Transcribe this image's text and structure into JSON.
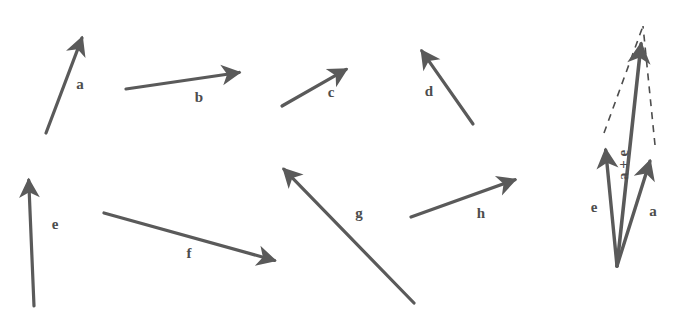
{
  "figure": {
    "background_color": "#ffffff",
    "stroke_color": "#5a5a5a",
    "label_color": "#4d4d4d",
    "width": 678,
    "height": 317
  },
  "vectors": [
    {
      "id": "a",
      "label": "a",
      "start": [
        46,
        133
      ],
      "end": [
        88,
        22
      ],
      "label_pos": [
        80,
        86
      ],
      "style": "solid",
      "arrowhead": "end"
    },
    {
      "id": "b",
      "label": "b",
      "start": [
        126,
        89
      ],
      "end": [
        256,
        70
      ],
      "label_pos": [
        199,
        99
      ],
      "style": "solid",
      "arrowhead": "end"
    },
    {
      "id": "c",
      "label": "c",
      "start": [
        282,
        106
      ],
      "end": [
        361,
        61
      ],
      "label_pos": [
        331,
        94
      ],
      "style": "solid",
      "arrowhead": "end"
    },
    {
      "id": "d",
      "label": "d",
      "start": [
        473,
        124
      ],
      "end": [
        412,
        37
      ],
      "label_pos": [
        429,
        93
      ],
      "style": "solid",
      "arrowhead": "end"
    },
    {
      "id": "e",
      "label": "e",
      "start": [
        34,
        306
      ],
      "end": [
        28,
        163
      ],
      "label_pos": [
        55,
        226
      ],
      "style": "solid",
      "arrowhead": "end"
    },
    {
      "id": "f",
      "label": "f",
      "start": [
        104,
        213
      ],
      "end": [
        291,
        265
      ],
      "label_pos": [
        189,
        255
      ],
      "style": "solid",
      "arrowhead": "end"
    },
    {
      "id": "g",
      "label": "g",
      "start": [
        414,
        303
      ],
      "end": [
        272,
        157
      ],
      "label_pos": [
        359,
        215
      ],
      "style": "solid",
      "arrowhead": "end"
    },
    {
      "id": "h",
      "label": "h",
      "start": [
        411,
        217
      ],
      "end": [
        531,
        174
      ],
      "label_pos": [
        481,
        215
      ],
      "style": "solid",
      "arrowhead": "end"
    }
  ],
  "sum_diagram": {
    "origin": [
      617,
      266
    ],
    "components": [
      {
        "id": "sum-e",
        "label": "e",
        "start": [
          617,
          266
        ],
        "end": [
          604,
          133
        ],
        "label_pos": [
          594,
          209
        ],
        "style": "solid",
        "arrowhead": "end"
      },
      {
        "id": "sum-a",
        "label": "a",
        "start": [
          617,
          266
        ],
        "end": [
          655,
          145
        ],
        "label_pos": [
          653,
          213
        ],
        "style": "solid",
        "arrowhead": "end"
      }
    ],
    "resultant": {
      "id": "sum-resultant",
      "label": "a + e",
      "start": [
        617,
        266
      ],
      "end": [
        643,
        26
      ],
      "label_pos": [
        625,
        165
      ],
      "label_rotation": -90,
      "style": "solid",
      "arrowhead": "end"
    },
    "construction_lines": [
      {
        "id": "dash-from-e",
        "start": [
          604,
          133
        ],
        "end": [
          643,
          26
        ],
        "style": "dashed"
      },
      {
        "id": "dash-from-a",
        "start": [
          655,
          145
        ],
        "end": [
          643,
          26
        ],
        "style": "dashed"
      }
    ]
  }
}
